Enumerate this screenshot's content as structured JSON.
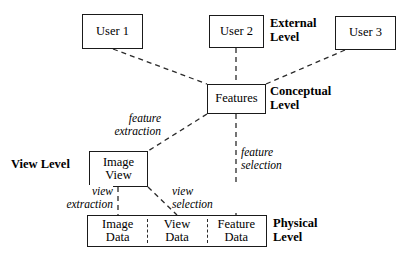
{
  "diagram": {
    "background_color": "#ffffff",
    "line_color": "#1a1a1a",
    "dashed_color": "#2a2a2a",
    "nodes": [
      {
        "id": "user1",
        "label": "User 1",
        "x": 82,
        "y": 14,
        "w": 61,
        "h": 35
      },
      {
        "id": "user2",
        "label": "User 2",
        "x": 209,
        "y": 15,
        "w": 55,
        "h": 33
      },
      {
        "id": "user3",
        "label": "User 3",
        "x": 335,
        "y": 16,
        "w": 61,
        "h": 34
      },
      {
        "id": "features",
        "label": "Features",
        "x": 207,
        "y": 84,
        "w": 59,
        "h": 30
      },
      {
        "id": "imageview",
        "label": "Image\nView",
        "x": 89,
        "y": 151,
        "w": 59,
        "h": 36
      }
    ],
    "physical_row": {
      "x": 87,
      "y": 215,
      "w": 180,
      "h": 32,
      "cells": [
        {
          "id": "image-data",
          "label": "Image\nData"
        },
        {
          "id": "view-data",
          "label": "View\nData"
        },
        {
          "id": "feature-data",
          "label": "Feature\nData"
        }
      ]
    },
    "level_labels": [
      {
        "id": "external-level",
        "label": "External\nLevel",
        "x": 270,
        "y": 17,
        "align": "left"
      },
      {
        "id": "conceptual-level",
        "label": "Conceptual\nLevel",
        "x": 270,
        "y": 85,
        "align": "left"
      },
      {
        "id": "view-level",
        "label": "View Level",
        "x": 11,
        "y": 158,
        "align": "left"
      },
      {
        "id": "physical-level",
        "label": "Physical\nLevel",
        "x": 273,
        "y": 217,
        "align": "left"
      }
    ],
    "edge_labels": [
      {
        "id": "feature-extraction",
        "label": "feature\nextraction",
        "x": 91,
        "y": 112,
        "align": "right",
        "width": 70
      },
      {
        "id": "feature-selection",
        "label": "feature\nselection",
        "x": 241,
        "y": 146,
        "align": "left",
        "width": 70
      },
      {
        "id": "view-extraction",
        "label": "view\nextraction",
        "x": 39,
        "y": 185,
        "align": "right",
        "width": 74
      },
      {
        "id": "view-selection",
        "label": "view\nselection",
        "x": 172,
        "y": 185,
        "align": "left",
        "width": 70
      }
    ],
    "edges": [
      {
        "id": "user1-features",
        "from": "user1",
        "to": "features",
        "x1": 113,
        "y1": 49,
        "x2": 207,
        "y2": 84
      },
      {
        "id": "user2-features",
        "from": "user2",
        "to": "features",
        "x1": 236,
        "y1": 48,
        "x2": 236,
        "y2": 84
      },
      {
        "id": "user3-features",
        "from": "user3",
        "to": "features",
        "x1": 345,
        "y1": 50,
        "x2": 266,
        "y2": 84
      },
      {
        "id": "features-imageview",
        "from": "features",
        "to": "imageview",
        "x1": 207,
        "y1": 114,
        "x2": 148,
        "y2": 151
      },
      {
        "id": "features-featuredata",
        "from": "features",
        "to": "feature-data",
        "x1": 236,
        "y1": 114,
        "x2": 236,
        "y2": 215
      },
      {
        "id": "imageview-imagedata",
        "from": "imageview",
        "to": "image-data",
        "x1": 118,
        "y1": 187,
        "x2": 118,
        "y2": 215
      },
      {
        "id": "imageview-viewdata",
        "from": "imageview",
        "to": "view-data",
        "x1": 148,
        "y1": 187,
        "x2": 177,
        "y2": 215
      }
    ]
  }
}
